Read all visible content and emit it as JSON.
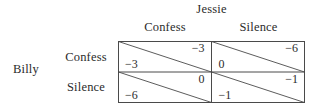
{
  "diagram": {
    "type": "payoff-matrix",
    "row_player": "Billy",
    "col_player": "Jessie",
    "row_strategies": [
      "Confess",
      "Silence"
    ],
    "col_strategies": [
      "Confess",
      "Silence"
    ],
    "cells": [
      {
        "row": "Confess",
        "col": "Confess",
        "row_payoff": "−3",
        "col_payoff": "−3"
      },
      {
        "row": "Confess",
        "col": "Silence",
        "row_payoff": "0",
        "col_payoff": "−6"
      },
      {
        "row": "Silence",
        "col": "Confess",
        "row_payoff": "−6",
        "col_payoff": "0"
      },
      {
        "row": "Silence",
        "col": "Silence",
        "row_payoff": "−1",
        "col_payoff": "−1"
      }
    ],
    "colors": {
      "line": "#4a4a4a",
      "text": "#2b2b2b",
      "background": "#ffffff"
    }
  }
}
